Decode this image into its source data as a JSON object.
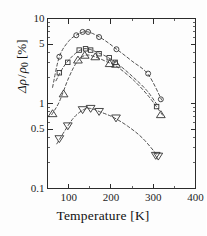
{
  "chart_data": {
    "type": "scatter",
    "title": "",
    "subtitle": "",
    "xlabel": "Temperature [K]",
    "ylabel": "Δρ / ρ₀ [%]",
    "xscale": "linear",
    "yscale": "log",
    "xlim": [
      50,
      400
    ],
    "ylim": [
      0.1,
      10
    ],
    "xticks": [
      100,
      200,
      300,
      400
    ],
    "xtick_labels": [
      "100",
      "200",
      "300",
      "400"
    ],
    "xminor_ticks": [
      50,
      150,
      250,
      350
    ],
    "yticks": [
      0.1,
      0.5,
      1,
      5,
      10
    ],
    "ytick_labels": [
      "0.1",
      "0.5",
      "1",
      "5",
      "10"
    ],
    "yminor_ticks": [
      0.2,
      0.3,
      0.4,
      0.6,
      0.7,
      0.8,
      0.9,
      2,
      3,
      4,
      6,
      7,
      8,
      9
    ],
    "grid": false,
    "legend": "none",
    "series": [
      {
        "name": "series-circle",
        "marker": "circle",
        "points": [
          {
            "x": 78,
            "y": 3.55
          },
          {
            "x": 118,
            "y": 6.35
          },
          {
            "x": 133,
            "y": 6.95
          },
          {
            "x": 146,
            "y": 6.95
          },
          {
            "x": 172,
            "y": 6.05
          },
          {
            "x": 213,
            "y": 4.35
          },
          {
            "x": 288,
            "y": 2.25
          },
          {
            "x": 318,
            "y": 1.12
          }
        ],
        "fit_curve": [
          {
            "x": 62,
            "y": 1.55
          },
          {
            "x": 78,
            "y": 3.55
          },
          {
            "x": 100,
            "y": 5.4
          },
          {
            "x": 120,
            "y": 6.45
          },
          {
            "x": 140,
            "y": 7.0
          },
          {
            "x": 160,
            "y": 6.55
          },
          {
            "x": 185,
            "y": 5.55
          },
          {
            "x": 215,
            "y": 4.3
          },
          {
            "x": 250,
            "y": 3.15
          },
          {
            "x": 288,
            "y": 2.2
          },
          {
            "x": 320,
            "y": 1.1
          }
        ]
      },
      {
        "name": "series-square",
        "marker": "square",
        "points": [
          {
            "x": 78,
            "y": 2.3
          },
          {
            "x": 98,
            "y": 3.05
          },
          {
            "x": 125,
            "y": 4.25
          },
          {
            "x": 140,
            "y": 4.4
          },
          {
            "x": 152,
            "y": 4.25
          },
          {
            "x": 172,
            "y": 3.85
          },
          {
            "x": 196,
            "y": 3.45
          },
          {
            "x": 210,
            "y": 3.05
          },
          {
            "x": 308,
            "y": 0.92
          }
        ],
        "fit_curve": [
          {
            "x": 70,
            "y": 1.85
          },
          {
            "x": 88,
            "y": 2.7
          },
          {
            "x": 110,
            "y": 3.65
          },
          {
            "x": 130,
            "y": 4.3
          },
          {
            "x": 145,
            "y": 4.4
          },
          {
            "x": 165,
            "y": 4.05
          },
          {
            "x": 190,
            "y": 3.55
          },
          {
            "x": 215,
            "y": 2.95
          },
          {
            "x": 250,
            "y": 2.1
          },
          {
            "x": 285,
            "y": 1.42
          },
          {
            "x": 312,
            "y": 0.92
          }
        ]
      },
      {
        "name": "series-triangle-up",
        "marker": "triangle-up",
        "points": [
          {
            "x": 62,
            "y": 0.76
          },
          {
            "x": 88,
            "y": 1.3
          },
          {
            "x": 122,
            "y": 3.25
          },
          {
            "x": 138,
            "y": 3.7
          },
          {
            "x": 163,
            "y": 3.55
          },
          {
            "x": 197,
            "y": 2.95
          },
          {
            "x": 212,
            "y": 2.9
          },
          {
            "x": 318,
            "y": 0.74
          }
        ],
        "fit_curve": [
          {
            "x": 60,
            "y": 0.74
          },
          {
            "x": 78,
            "y": 1.05
          },
          {
            "x": 100,
            "y": 2.0
          },
          {
            "x": 120,
            "y": 3.1
          },
          {
            "x": 140,
            "y": 3.7
          },
          {
            "x": 162,
            "y": 3.55
          },
          {
            "x": 190,
            "y": 3.1
          },
          {
            "x": 215,
            "y": 2.7
          },
          {
            "x": 255,
            "y": 1.85
          },
          {
            "x": 290,
            "y": 1.2
          },
          {
            "x": 322,
            "y": 0.73
          }
        ]
      },
      {
        "name": "series-triangle-down",
        "marker": "triangle-down",
        "points": [
          {
            "x": 78,
            "y": 0.385
          },
          {
            "x": 98,
            "y": 0.545
          },
          {
            "x": 133,
            "y": 0.845
          },
          {
            "x": 152,
            "y": 0.875
          },
          {
            "x": 172,
            "y": 0.805
          },
          {
            "x": 212,
            "y": 0.675
          },
          {
            "x": 306,
            "y": 0.245
          },
          {
            "x": 312,
            "y": 0.24
          }
        ],
        "fit_curve": [
          {
            "x": 72,
            "y": 0.335
          },
          {
            "x": 90,
            "y": 0.47
          },
          {
            "x": 112,
            "y": 0.68
          },
          {
            "x": 135,
            "y": 0.845
          },
          {
            "x": 152,
            "y": 0.875
          },
          {
            "x": 175,
            "y": 0.795
          },
          {
            "x": 205,
            "y": 0.69
          },
          {
            "x": 240,
            "y": 0.54
          },
          {
            "x": 275,
            "y": 0.39
          },
          {
            "x": 310,
            "y": 0.245
          }
        ]
      }
    ]
  },
  "axis": {
    "x_label": "Temperature [K]",
    "y_label_numerator": "Δρ",
    "y_label_denominator": "ρ",
    "y_label_subscript": "0",
    "y_label_unit": "[%]",
    "x_tick_100": "100",
    "x_tick_200": "200",
    "x_tick_300": "300",
    "x_tick_400": "400",
    "y_tick_10": "10",
    "y_tick_5": "5",
    "y_tick_1": "1",
    "y_tick_05": "0.5",
    "y_tick_01": "0.1"
  },
  "style": {
    "axis_color": "#2b2b2b",
    "marker_color": "#333333",
    "curve_color": "#3c3c3c",
    "background": "#fdfdfd"
  }
}
